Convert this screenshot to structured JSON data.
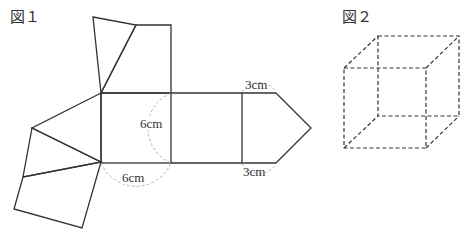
{
  "figure1": {
    "title": "図１",
    "labels": {
      "square_side": "6cm",
      "square_bottom": "6cm",
      "pentagon_top": "3cm",
      "pentagon_bottom": "3cm"
    }
  },
  "figure2": {
    "title": "図２"
  }
}
